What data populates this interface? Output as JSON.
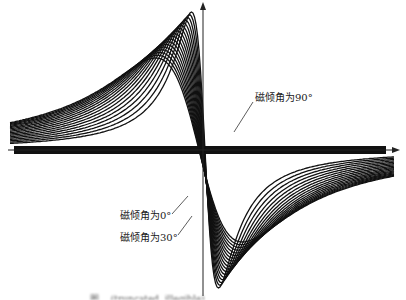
{
  "chart_data": {
    "type": "line",
    "title": "",
    "xlabel": "",
    "ylabel": "",
    "grid": false,
    "legend": "none (inline annotations)",
    "axes": {
      "x_axis": "horizontal arrow through center, pointing right",
      "y_axis": "vertical arrow through center, pointing up",
      "tick_labels": []
    },
    "curve_shape": "antisymmetric bipolar signal (positive peak left of center, negative trough right of center), tails decaying to zero",
    "series_count_estimate": 18,
    "parameter": "magnetic inclination angle from 0° to 90°",
    "series": [
      {
        "name": "磁倾角为0°",
        "peak": 0.72,
        "trough": -0.72,
        "width": 1.6
      },
      {
        "name": "磁倾角为30°",
        "peak": 0.8,
        "trough": -0.8,
        "width": 1.3
      },
      {
        "name": "磁倾角为90°",
        "peak": 1.0,
        "trough": -1.0,
        "width": 0.55
      }
    ],
    "annotations": [
      {
        "text": "磁倾角为90°",
        "points_to": "steepest central curve"
      },
      {
        "text": "磁倾角为0°",
        "points_to": "lower-left flank"
      },
      {
        "text": "磁倾角为30°",
        "points_to": "lower-left flank"
      }
    ],
    "caption": "图… (truncated, illegible)"
  },
  "labels": {
    "inc90": "磁倾角为90°",
    "inc0": "磁倾角为0°",
    "inc30": "磁倾角为30°"
  },
  "colors": {
    "curve": "#111111",
    "axis": "#222222",
    "background": "#ffffff"
  }
}
